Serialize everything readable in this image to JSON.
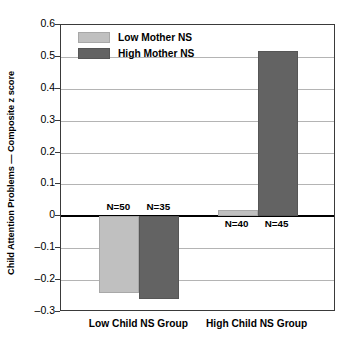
{
  "chart_data": {
    "type": "bar",
    "title": "",
    "xlabel": "",
    "ylabel": "Child Attention Problems — Composite z score",
    "categories": [
      "Low Child NS Group",
      "High Child NS Group"
    ],
    "ylim": [
      -0.3,
      0.6
    ],
    "yticks": [
      "0.6",
      "0.5",
      "0.4",
      "0.3",
      "0.2",
      "0.1",
      "0",
      "–0.1",
      "–0.2",
      "–0.3"
    ],
    "ytick_values": [
      0.6,
      0.5,
      0.4,
      0.3,
      0.2,
      0.1,
      0,
      -0.1,
      -0.2,
      -0.3
    ],
    "grid": true,
    "legend_position": "upper-left-inside",
    "series": [
      {
        "name": "Low Mother NS",
        "color": "#c0c0c0",
        "values": [
          -0.24,
          0.02
        ],
        "n_labels": [
          "N=50",
          "N=40"
        ]
      },
      {
        "name": "High Mother NS",
        "color": "#636363",
        "values": [
          -0.26,
          0.52
        ],
        "n_labels": [
          "N=35",
          "N=45"
        ]
      }
    ],
    "annotations": [
      "N=50",
      "N=35",
      "N=40",
      "N=45"
    ]
  },
  "legend": {
    "items": [
      {
        "label": "Low Mother NS",
        "color": "#c0c0c0"
      },
      {
        "label": "High Mother NS",
        "color": "#636363"
      }
    ]
  },
  "axes": {
    "y_title": "Child Attention Problems — Composite z score"
  }
}
